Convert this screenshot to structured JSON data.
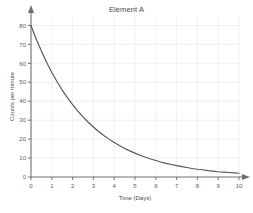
{
  "chart_data": {
    "type": "line",
    "title": "Element A",
    "xlabel": "Time (Days)",
    "ylabel": "Counts per minute",
    "xlim": [
      0,
      10
    ],
    "ylim": [
      0,
      85
    ],
    "grid": true,
    "legend": "none",
    "x_ticks": [
      0,
      1,
      2,
      3,
      4,
      5,
      6,
      7,
      8,
      9,
      10
    ],
    "y_ticks": [
      0,
      10,
      20,
      30,
      40,
      50,
      60,
      70,
      80
    ],
    "series": [
      {
        "name": "Element A decay",
        "x": [
          0,
          0.25,
          0.5,
          0.75,
          1,
          1.25,
          1.5,
          1.75,
          2,
          2.25,
          2.5,
          2.75,
          3,
          3.25,
          3.5,
          3.75,
          4,
          4.25,
          4.5,
          4.75,
          5,
          5.25,
          5.5,
          5.75,
          6,
          6.25,
          6.5,
          6.75,
          7,
          7.25,
          7.5,
          7.75,
          8,
          8.25,
          8.5,
          8.75,
          9,
          9.25,
          9.5,
          9.75,
          10
        ],
        "values": [
          80,
          72.9,
          66.5,
          60.6,
          55.2,
          50.4,
          45.9,
          41.9,
          38.2,
          34.8,
          31.7,
          28.9,
          26.4,
          24.0,
          21.9,
          20.0,
          18.2,
          16.6,
          15.1,
          13.8,
          12.6,
          11.5,
          10.4,
          9.5,
          8.7,
          7.9,
          7.2,
          6.6,
          6.0,
          5.5,
          5.0,
          4.5,
          4.1,
          3.8,
          3.4,
          3.1,
          2.8,
          2.6,
          2.4,
          2.2,
          2.0
        ]
      }
    ]
  },
  "style": {
    "curve_color": "#555555",
    "axis_color": "#6e6e6e",
    "grid_color": "#f0f0f0",
    "title_color": "#4a4a4a"
  },
  "footer": {
    "artifact_text": ""
  }
}
